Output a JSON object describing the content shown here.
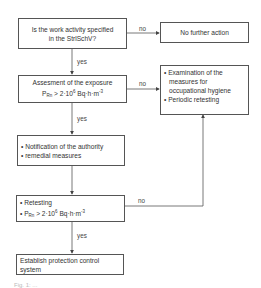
{
  "nodes": {
    "q_activity": {
      "line1": "Is the work activity specified",
      "line2": "in the StrlSchV?"
    },
    "no_action": {
      "text": "No further action"
    },
    "assessment": {
      "line1": "Assesment of the exposure",
      "formula_p": "P",
      "formula_sub": "Rn",
      "formula_rest": " > 2·10",
      "formula_sup": "6",
      "formula_unit": " Bq·h·m",
      "formula_unit_sup": "-3"
    },
    "examination": {
      "items": [
        "• Examination of the",
        "measures for",
        "occupational hygiene",
        "• Periodic retesting"
      ]
    },
    "notification": {
      "items": [
        "• Notification of the authority",
        "• remedial measures"
      ]
    },
    "retesting": {
      "item1": "• Retesting",
      "bullet": "• P",
      "formula_sub": "Rn",
      "formula_rest": " > 2·10",
      "formula_sup": "6",
      "formula_unit": " Bq·h·m",
      "formula_unit_sup": "-3"
    },
    "establish": {
      "line1": "Establish protection control",
      "line2": "system"
    }
  },
  "edge_labels": {
    "no1": "no",
    "yes1": "yes",
    "no2": "no",
    "yes2": "yes",
    "no3": "no",
    "yes3": "yes"
  },
  "caption": "Fig. 1: ..."
}
